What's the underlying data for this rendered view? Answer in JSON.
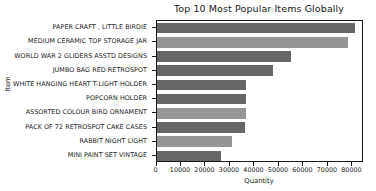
{
  "chart_data": {
    "type": "bar",
    "orientation": "horizontal",
    "title": "Top 10 Most Popular Items Globally",
    "xlabel": "Quantity",
    "ylabel": "Item",
    "categories": [
      "PAPER CRAFT , LITTLE BIRDIE",
      "MEDIUM CERAMIC TOP STORAGE JAR",
      "WORLD WAR 2 GLIDERS ASSTD DESIGNS",
      "JUMBO BAG RED RETROSPOT",
      "WHITE HANGING HEART T-LIGHT HOLDER",
      "POPCORN HOLDER",
      "ASSORTED COLOUR BIRD ORNAMENT",
      "PACK OF 72 RETROSPOT CAKE CASES",
      "RABBIT NIGHT LIGHT",
      "MINI PAINT SET VINTAGE"
    ],
    "values": [
      80995,
      78033,
      54951,
      47363,
      36725,
      36396,
      36362,
      36039,
      30680,
      26437
    ],
    "bar_colors": [
      "#666666",
      "#969696",
      "#666666",
      "#666666",
      "#666666",
      "#666666",
      "#969696",
      "#666666",
      "#969696",
      "#666666"
    ],
    "xticks": [
      0,
      10000,
      20000,
      30000,
      40000,
      50000,
      60000,
      70000,
      80000
    ],
    "xticklabels": [
      "0",
      "10000",
      "20000",
      "30000",
      "40000",
      "50000",
      "60000",
      "70000",
      "80000"
    ],
    "xlim": [
      0,
      84500
    ],
    "grid": false,
    "legend": null
  }
}
